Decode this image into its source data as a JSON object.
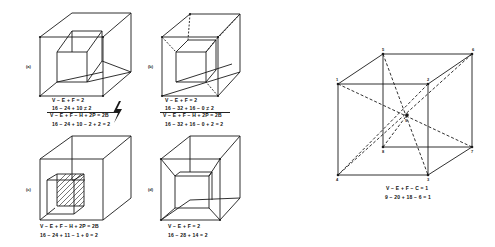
{
  "panels": {
    "a": {
      "label": "(a)",
      "eq1": "V − E + F = 2",
      "eq2": "16 − 24 + 10 ≠ 2",
      "eq3": "V − E + F − H + 2P = 2B",
      "eq4": "16 − 24 + 10 − 2 + 2 = 2"
    },
    "b": {
      "label": "(b)",
      "eq1": "V − E + F = 2",
      "eq2": "16 − 32 + 16 − 0 ≠ 2",
      "eq3": "V − E + F − H + 2P = 2B",
      "eq4": "16 − 32 + 16 − 0 + 2 = 2"
    },
    "c": {
      "label": "(c)",
      "eq1": "V − E + F − H + 2P = 2B",
      "eq2": "16 − 24 + 11 − 1 + 0 = 2"
    },
    "d": {
      "label": "(d)",
      "eq1": "V − E + F = 2",
      "eq2": "16 − 28 + 14 = 2"
    },
    "e": {
      "eq1": "V − E + F − C = 1",
      "eq2": "9 − 20 + 18 − 6 = 1",
      "vertex_labels": [
        "1",
        "2",
        "3",
        "4",
        "5",
        "6",
        "7",
        "8",
        "9"
      ]
    }
  },
  "lightning_icon": "lightning-bolt",
  "colors": {
    "ink": "#1a1a1a",
    "background": "#ffffff"
  }
}
